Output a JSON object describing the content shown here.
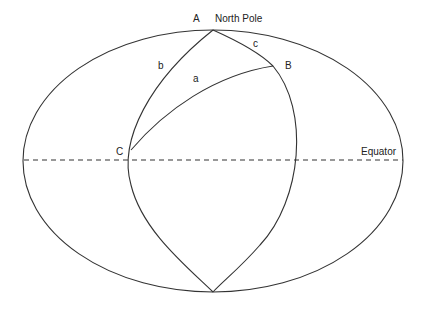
{
  "diagram": {
    "type": "spherical-triangle",
    "labels": {
      "vertex_a": "A",
      "north_pole": "North Pole",
      "vertex_b": "B",
      "vertex_c": "C",
      "side_a": "a",
      "side_b": "b",
      "side_c": "c",
      "equator": "Equator"
    },
    "colors": {
      "line": "#333333",
      "text": "#222222",
      "background": "#ffffff"
    }
  }
}
